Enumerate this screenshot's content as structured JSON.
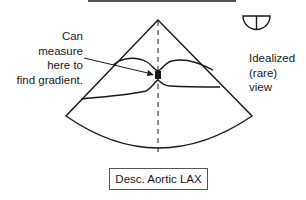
{
  "diagram": {
    "title_bar": "",
    "annotation_left": {
      "line1": "Can",
      "line2": "measure",
      "line3": "here to",
      "line4": "find gradient."
    },
    "annotation_right": {
      "line1": "Idealized",
      "line2": "(rare)",
      "line3": "view"
    },
    "view_label": "Desc. Aortic LAX",
    "icons": {
      "orientation_icon": "half-circle-with-vertical-line",
      "sector": "ultrasound-sector",
      "coarctation_marker": "filled-square"
    },
    "colors": {
      "line": "#1a1a1a",
      "background": "#ffffff"
    }
  }
}
